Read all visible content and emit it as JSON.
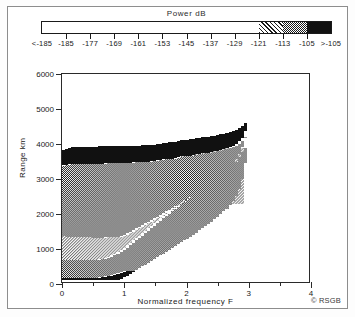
{
  "figure": {
    "credit": "© RSGB"
  },
  "legend": {
    "title": "Power dB",
    "labels": [
      "<-185",
      "-185",
      "-177",
      "-169",
      "-161",
      "-153",
      "-145",
      "-137",
      "-129",
      "-121",
      "-113",
      "-105",
      ">-105"
    ],
    "segments": [
      {
        "pattern": "white",
        "from": "-185",
        "to": "-121"
      },
      {
        "pattern": "diagonal-hatch",
        "from": "-121",
        "to": "-113"
      },
      {
        "pattern": "checker",
        "from": "-113",
        "to": "-105"
      },
      {
        "pattern": "solid-black",
        "from": "-105",
        "to": ">-105"
      }
    ]
  },
  "axes": {
    "y_title": "Range   km",
    "x_title": "Normalized frequency   F",
    "y_ticks": [
      "0",
      "1000",
      "2000",
      "3000",
      "4000",
      "5000",
      "6000"
    ],
    "x_ticks": [
      "0",
      "1",
      "2",
      "3",
      "4"
    ]
  },
  "chart_data": {
    "type": "area",
    "title": "Power dB",
    "xlabel": "Normalized frequency   F",
    "ylabel": "Range   km",
    "xlim": [
      0,
      4
    ],
    "ylim": [
      0,
      6000
    ],
    "xtick_values": [
      0,
      1,
      2,
      3,
      4
    ],
    "xminor_values": [
      0.5,
      1.5,
      2.5,
      3.5
    ],
    "ytick_values": [
      0,
      1000,
      2000,
      3000,
      4000,
      5000,
      6000
    ],
    "grid": false,
    "legend_position": "top",
    "series": [
      {
        "name": "upper-black-band-top",
        "pattern": "solid-black",
        "power_dB": ">-105",
        "x": [
          0.0,
          0.15,
          0.3,
          0.45,
          0.6,
          0.75,
          0.9,
          1.05,
          1.2,
          1.35,
          1.5,
          1.65,
          1.8,
          1.95,
          2.1,
          2.25,
          2.4,
          2.55,
          2.7,
          2.8,
          2.88,
          2.94,
          2.98,
          3.01,
          3.04
        ],
        "values": [
          3820,
          3900,
          3900,
          3905,
          3910,
          3915,
          3920,
          3930,
          3935,
          3945,
          3960,
          4020,
          4030,
          4100,
          4115,
          4180,
          4200,
          4260,
          4330,
          4400,
          4480,
          4570,
          4660,
          4740,
          4760
        ]
      },
      {
        "name": "upper-black-band-bottom",
        "pattern": "boundary",
        "x": [
          0.0,
          0.15,
          0.3,
          0.45,
          0.6,
          0.75,
          0.9,
          1.05,
          1.2,
          1.35,
          1.5,
          1.65,
          1.8,
          1.95,
          2.1,
          2.25,
          2.4,
          2.55,
          2.7,
          2.8,
          2.88,
          2.94,
          2.98,
          3.01,
          3.04
        ],
        "values": [
          3640,
          3700,
          3705,
          3710,
          3715,
          3720,
          3725,
          3735,
          3740,
          3750,
          3770,
          3830,
          3840,
          3910,
          3925,
          3990,
          4010,
          4070,
          4140,
          4215,
          4300,
          4390,
          4490,
          4600,
          4700
        ]
      },
      {
        "name": "upper-checker-band-bottom",
        "pattern": "checker",
        "power_dB": "-113 to -105",
        "x": [
          0.0,
          0.15,
          0.3,
          0.45,
          0.6,
          0.75,
          0.9,
          1.05,
          1.2,
          1.35,
          1.5,
          1.65,
          1.8,
          1.95,
          2.1,
          2.25,
          2.4,
          2.55,
          2.7,
          2.8,
          2.88,
          2.94,
          2.98,
          3.01,
          3.04
        ],
        "values": [
          3350,
          3400,
          3405,
          3410,
          3415,
          3420,
          3430,
          3440,
          3450,
          3460,
          3480,
          3540,
          3555,
          3620,
          3640,
          3700,
          3725,
          3790,
          3860,
          3940,
          4040,
          4160,
          4300,
          4470,
          4640
        ]
      },
      {
        "name": "middle-hatch-band-bottom",
        "pattern": "diagonal-hatch",
        "power_dB": "-121 to -113",
        "x": [
          0.0,
          0.15,
          0.3,
          0.45,
          0.6,
          0.75,
          0.9,
          1.0,
          1.1,
          1.25,
          1.4,
          1.55,
          1.7,
          1.85,
          2.0,
          2.15,
          2.3,
          2.45,
          2.6,
          2.72,
          2.82,
          2.9,
          2.96,
          3.0,
          3.04
        ],
        "values": [
          1320,
          1300,
          1290,
          1285,
          1280,
          1285,
          1300,
          1330,
          1420,
          1570,
          1720,
          1870,
          2020,
          2180,
          2340,
          2510,
          2680,
          2860,
          3060,
          3260,
          3470,
          3700,
          3960,
          4250,
          4600
        ]
      },
      {
        "name": "lower-checker-band-bottom",
        "pattern": "checker",
        "power_dB": "-113 to -105",
        "x": [
          0.0,
          0.1,
          0.2,
          0.3,
          0.4,
          0.5,
          0.6,
          0.7,
          0.8,
          0.9,
          1.0,
          1.1,
          1.25,
          1.4,
          1.55,
          1.7,
          1.85,
          2.0,
          2.2,
          2.4,
          2.6,
          2.8,
          2.95,
          3.02
        ],
        "values": [
          640,
          635,
          630,
          628,
          628,
          632,
          645,
          680,
          740,
          830,
          950,
          1090,
          1300,
          1520,
          1740,
          1950,
          2160,
          2360,
          2620,
          2880,
          3160,
          3480,
          3900,
          4400
        ]
      },
      {
        "name": "lower-black-band-bottom",
        "pattern": "solid-black",
        "power_dB": ">-105",
        "x": [
          0.0,
          0.1,
          0.2,
          0.3,
          0.4,
          0.5,
          0.6,
          0.7,
          0.8,
          0.9,
          1.0,
          1.05
        ],
        "values": [
          115,
          112,
          110,
          110,
          112,
          118,
          130,
          150,
          180,
          225,
          290,
          330
        ]
      },
      {
        "name": "right-boundary-envelope",
        "pattern": "edge",
        "x": [
          0.95,
          1.05,
          1.2,
          1.35,
          1.5,
          1.65,
          1.8,
          1.95,
          2.1,
          2.25,
          2.4,
          2.55,
          2.7,
          2.82,
          2.92,
          2.99,
          3.04
        ],
        "values": [
          60,
          150,
          320,
          480,
          640,
          800,
          960,
          1130,
          1300,
          1480,
          1670,
          1880,
          2120,
          2400,
          2780,
          3400,
          4700
        ]
      }
    ],
    "peak": {
      "x": 3.02,
      "range_km": 4760,
      "note": "maximum range at normalized frequency ≈ 3"
    }
  }
}
